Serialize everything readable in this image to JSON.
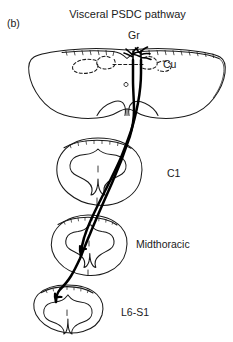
{
  "figure": {
    "panel_letter": "(b)",
    "title": "Visceral PSDC pathway",
    "background_color": "#ffffff",
    "line_color": "#1a1a1a"
  },
  "labels": {
    "gracile_nucleus": "Gr",
    "cuneate_nucleus": "Cu",
    "c1_level": "C1",
    "midthoracic_level": "Midthoracic",
    "lumbosacral_level": "L6-S1"
  },
  "sections": [
    {
      "name": "medulla",
      "label": "",
      "cx": 127,
      "cy": 84,
      "rx": 97,
      "ry": 37
    },
    {
      "name": "c1-spinal-cord",
      "label": "C1",
      "cx": 98,
      "cy": 172,
      "rx": 43,
      "ry": 34
    },
    {
      "name": "midthoracic-spinal-cord",
      "label": "Midthoracic",
      "cx": 88,
      "cy": 245,
      "rx": 38,
      "ry": 31
    },
    {
      "name": "lumbosacral-spinal-cord",
      "label": "L6-S1",
      "cx": 67,
      "cy": 308,
      "rx": 35,
      "ry": 24
    }
  ],
  "tracts": [
    {
      "name": "psdc-axon-from-midthoracic",
      "origin_section": "midthoracic-spinal-cord",
      "terminates_in": "Gr"
    },
    {
      "name": "psdc-axon-from-lumbosacral",
      "origin_section": "lumbosacral-spinal-cord",
      "terminates_in": "Gr"
    }
  ]
}
